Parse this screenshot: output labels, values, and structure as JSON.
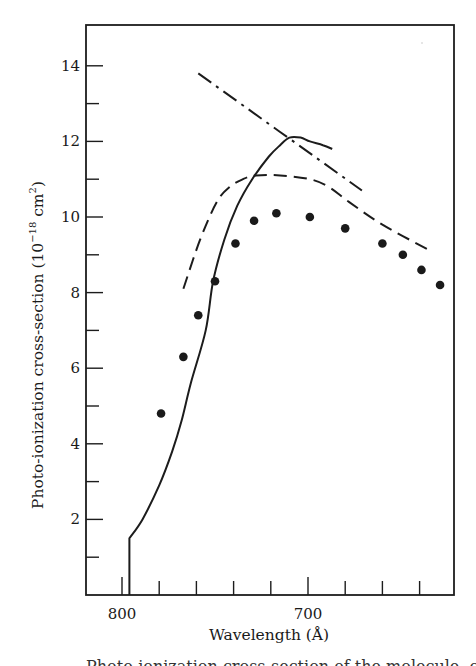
{
  "chart_data": {
    "type": "line",
    "title": "",
    "xlabel": "Wavelength (Å)",
    "ylabel": "Photo-ionization cross-section (10⁻¹⁸ cm²)",
    "ylabel_parts": {
      "main": "Photo-ionization cross-section (10",
      "sup1": "−18",
      "mid": " cm",
      "sup2": "2",
      "end": ")"
    },
    "xlim": [
      819,
      620
    ],
    "ylim": [
      0,
      14.9
    ],
    "x_reversed": true,
    "grid": false,
    "legend": "none",
    "x_ticks": [
      800,
      780,
      760,
      740,
      720,
      700,
      680,
      660,
      640
    ],
    "x_tick_labels": [
      {
        "value": 800,
        "label": "800"
      },
      {
        "value": 700,
        "label": "700"
      }
    ],
    "y_ticks": [
      1,
      2,
      3,
      4,
      5,
      6,
      7,
      8,
      9,
      10,
      11,
      12,
      13,
      14
    ],
    "y_tick_labels": [
      {
        "value": 2,
        "label": "2"
      },
      {
        "value": 4,
        "label": "4"
      },
      {
        "value": 6,
        "label": "6"
      },
      {
        "value": 8,
        "label": "8"
      },
      {
        "value": 10,
        "label": "10"
      },
      {
        "value": 12,
        "label": "12"
      },
      {
        "value": 14,
        "label": "14"
      }
    ],
    "series": [
      {
        "name": "experimental points",
        "style": "dots",
        "x": [
          779,
          767,
          759,
          750,
          739,
          729,
          717,
          699,
          680,
          660,
          649,
          639,
          629
        ],
        "y": [
          4.8,
          6.3,
          7.4,
          8.3,
          9.3,
          9.9,
          10.1,
          10.0,
          9.7,
          9.3,
          9.0,
          8.6,
          8.2
        ]
      },
      {
        "name": "theory (solid)",
        "style": "solid",
        "x": [
          796,
          796,
          789,
          780,
          773,
          768,
          763,
          755,
          751,
          745,
          738,
          730,
          721,
          715,
          710,
          704,
          699,
          692,
          687
        ],
        "y": [
          0,
          1.5,
          2.0,
          2.9,
          3.8,
          4.6,
          5.6,
          7.0,
          8.3,
          9.4,
          10.3,
          11.0,
          11.6,
          11.9,
          12.1,
          12.1,
          12.0,
          11.9,
          11.8
        ]
      },
      {
        "name": "theory (dashed)",
        "style": "dashed",
        "x": [
          767,
          758,
          749,
          742,
          735,
          728,
          715,
          699,
          689,
          678,
          660,
          634
        ],
        "y": [
          8.1,
          9.4,
          10.4,
          10.8,
          11.0,
          11.1,
          11.1,
          11.0,
          10.8,
          10.4,
          9.8,
          9.1
        ]
      },
      {
        "name": "theory (dash-dot)",
        "style": "dashdot",
        "x": [
          759,
          671
        ],
        "y": [
          13.8,
          10.7
        ]
      }
    ]
  },
  "caption_partial": "Photo-ionization cross-section of the molecule, calculated and measured"
}
